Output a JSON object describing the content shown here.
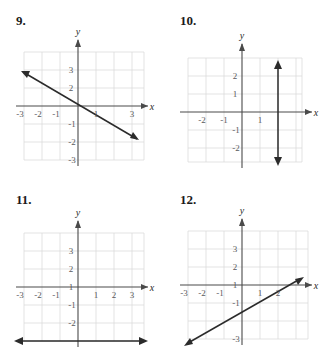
{
  "page": {
    "background_color": "#ffffff",
    "grid_color": "#dcdcdc",
    "axis_color": "#4a4a4a",
    "line_color": "#2b2b2b",
    "tick_label_color": "#59595c"
  },
  "problems": [
    {
      "number": "9.",
      "axis_x_label": "x",
      "axis_y_label": "y",
      "x_ticks": [
        "-3",
        "-2",
        "-1",
        "1",
        "3"
      ],
      "y_ticks": [
        "3",
        "2",
        "-1",
        "-2",
        "-3"
      ],
      "graph": {
        "type": "line",
        "description": "decreasing line with negative slope, double arrow",
        "slope": -0.6,
        "y_intercept": 1.5,
        "x_intercept": 2.5
      }
    },
    {
      "number": "10.",
      "axis_x_label": "x",
      "axis_y_label": "y",
      "x_ticks": [
        "-2",
        "-1",
        "1"
      ],
      "y_ticks": [
        "2",
        "1",
        "-1",
        "-2"
      ],
      "graph": {
        "type": "vertical-line",
        "description": "vertical line with arrows at both ends",
        "equation_x": 2
      }
    },
    {
      "number": "11.",
      "axis_x_label": "x",
      "axis_y_label": "y",
      "x_ticks": [
        "-3",
        "-2",
        "-1",
        "1",
        "2",
        "3"
      ],
      "y_ticks": [
        "3",
        "2",
        "1",
        "-1",
        "-2"
      ],
      "graph": {
        "type": "horizontal-line",
        "description": "horizontal line with arrows at both ends",
        "equation_y": -3
      }
    },
    {
      "number": "12.",
      "axis_x_label": "x",
      "axis_y_label": "y",
      "x_ticks": [
        "-3",
        "-2",
        "-1",
        "1",
        "2"
      ],
      "y_ticks": [
        "3",
        "2",
        "1",
        "-1",
        "-3"
      ],
      "graph": {
        "type": "line",
        "description": "increasing line with positive slope, double arrow",
        "slope": 0.8,
        "y_intercept": -2,
        "x_intercept": 2.5
      }
    }
  ]
}
